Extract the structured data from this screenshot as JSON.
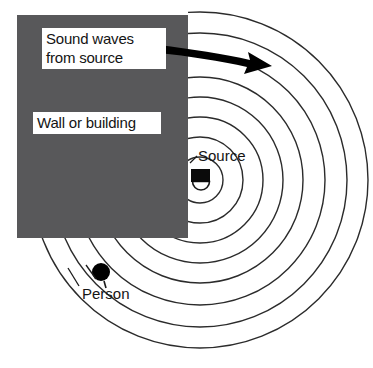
{
  "diagram": {
    "type": "physics-diagram",
    "canvas": {
      "width": 373,
      "height": 368,
      "background": "#ffffff"
    },
    "labels": {
      "sound_waves": "Sound waves\nfrom source",
      "sound_waves_line1": "Sound waves",
      "sound_waves_line2": "from source",
      "wall": "Wall or building",
      "source": "Source",
      "person": "Person"
    },
    "colors": {
      "wall_fill": "#58585a",
      "wave_stroke": "#2b2b2b",
      "arrow_fill": "#000000",
      "text": "#141414",
      "label_box_bg": "#ffffff",
      "label_box_border": "#9a9a9a",
      "marker_fill": "#000000"
    },
    "wall": {
      "x": 17,
      "y": 15,
      "width": 171,
      "height": 223
    },
    "source": {
      "center_x": 200,
      "center_y": 180,
      "icon": "speaker-icon"
    },
    "person": {
      "center_x": 101,
      "center_y": 272,
      "radius": 9,
      "icon": "person-dot-icon"
    },
    "arrow": {
      "name": "sound-direction-arrow",
      "start_x": 160,
      "start_y": 48,
      "end_x": 268,
      "end_y": 66
    },
    "wavefronts": {
      "count": 8,
      "radii": [
        23,
        43,
        63,
        83,
        103,
        125,
        147,
        168
      ],
      "description": "Concentric circular wavefronts emanating from the source, blocked above by the wall and diffracting around its lower-right corner into the shadow region."
    }
  }
}
